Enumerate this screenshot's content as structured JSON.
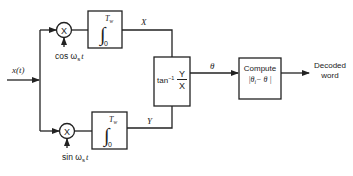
{
  "diagram": {
    "input": {
      "label": "x(t)",
      "label_sub": ""
    },
    "multipliers": [
      {
        "id": "top",
        "symbol": "X",
        "ref_label": "cos ω",
        "ref_sub": "s",
        "ref_tail": "t"
      },
      {
        "id": "bottom",
        "symbol": "X",
        "ref_label": "sin ω",
        "ref_sub": "s",
        "ref_tail": "t"
      }
    ],
    "integrators": [
      {
        "id": "top",
        "symbol": "∫",
        "upper": "T",
        "upper_sub": "w",
        "lower": "0",
        "output_label": "X"
      },
      {
        "id": "bottom",
        "symbol": "∫",
        "upper": "T",
        "upper_sub": "w",
        "lower": "0",
        "output_label": "Y"
      }
    ],
    "arctan_block": {
      "prefix": "tan",
      "exp": "−1",
      "numerator": "Y",
      "denominator": "X",
      "output_label": "θ"
    },
    "compute_block": {
      "line1": "Compute",
      "line2": "|θ",
      "line2_sub": "i",
      "line2_tail": "− θ |"
    },
    "output": {
      "line1": "Decoded",
      "line2": "word"
    }
  }
}
